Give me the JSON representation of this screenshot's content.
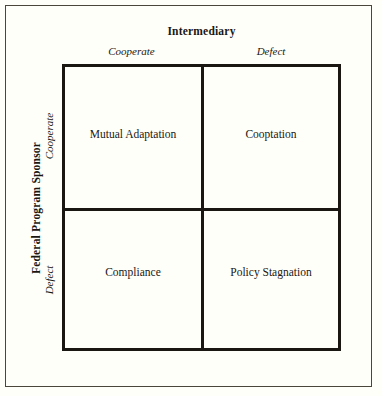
{
  "figure": {
    "background_color": "#fffffa",
    "line_color": "#1a1713",
    "frame_color": "#4a463c"
  },
  "column_axis": {
    "title": "Intermediary",
    "labels": [
      "Cooperate",
      "Defect"
    ]
  },
  "row_axis": {
    "title": "Federal Program Sponsor",
    "labels": [
      "Cooperate",
      "Defect"
    ]
  },
  "matrix": {
    "rows": [
      {
        "cells": [
          "Mutual Adaptation",
          "Cooptation"
        ]
      },
      {
        "cells": [
          "Compliance",
          "Policy Stagnation"
        ]
      }
    ]
  }
}
